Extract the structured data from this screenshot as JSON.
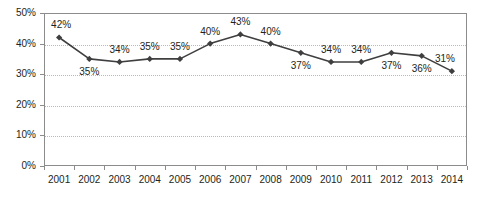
{
  "chart_data": {
    "type": "line",
    "title": "",
    "xlabel": "",
    "ylabel": "",
    "categories": [
      "2001",
      "2002",
      "2003",
      "2004",
      "2005",
      "2006",
      "2007",
      "2008",
      "2009",
      "2010",
      "2011",
      "2012",
      "2013",
      "2014"
    ],
    "values": [
      42,
      35,
      34,
      35,
      35,
      40,
      43,
      40,
      37,
      34,
      34,
      37,
      36,
      31
    ],
    "point_labels": [
      "42%",
      "35%",
      "34%",
      "35%",
      "35%",
      "40%",
      "43%",
      "40%",
      "37%",
      "34%",
      "34%",
      "37%",
      "36%",
      "31%"
    ],
    "label_positions": [
      "above",
      "below",
      "above",
      "above",
      "above",
      "above",
      "above",
      "above",
      "below",
      "above",
      "above",
      "below",
      "below",
      "above"
    ],
    "ylim": [
      0,
      50
    ],
    "ytick_values": [
      0,
      10,
      20,
      30,
      40,
      50
    ],
    "ytick_labels": [
      "0%",
      "10%",
      "20%",
      "30%",
      "40%",
      "50%"
    ],
    "grid": true,
    "gridlines_at": [
      10,
      20,
      30,
      40
    ],
    "legend": "none",
    "series_color": "#3f3f3f",
    "marker": "diamond",
    "axis_color": "#8c8c8c",
    "grid_color": "#b9b9b9",
    "text_color": "#231f20"
  }
}
